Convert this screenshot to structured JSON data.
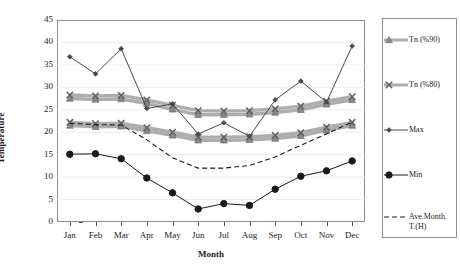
{
  "chart_data": {
    "type": "line",
    "title": "",
    "xlabel": "Month",
    "ylabel": "Temperature",
    "categories": [
      "Jan",
      "Feb",
      "Mar",
      "Apr",
      "May",
      "Jun",
      "Jul",
      "Aug",
      "Sep",
      "Oct",
      "Nov",
      "Dec"
    ],
    "ylim": [
      0,
      45
    ],
    "yticks": [
      0,
      5,
      10,
      15,
      20,
      25,
      30,
      35,
      40,
      45
    ],
    "grid": "horizontal-faint",
    "legend_position": "right-outside",
    "series": [
      {
        "name": "Tn (%90) upper",
        "legend": "Tn  (%90)",
        "marker": "triangle",
        "color": "#8a8a8a",
        "values": [
          27.5,
          27.3,
          27.4,
          26.4,
          25.1,
          23.9,
          23.9,
          24.0,
          24.4,
          25.0,
          26.2,
          27.2
        ]
      },
      {
        "name": "Tn (%80) upper",
        "legend": "Tn  (%80)",
        "marker": "cross",
        "color": "#8a8a8a",
        "values": [
          28.3,
          28.1,
          28.2,
          27.2,
          26.0,
          24.8,
          24.7,
          24.8,
          25.2,
          25.8,
          26.9,
          27.9
        ]
      },
      {
        "name": "Tn (%90) lower",
        "legend": "Tn  (%90)",
        "marker": "triangle",
        "color": "#8a8a8a",
        "values": [
          21.5,
          21.2,
          21.3,
          20.3,
          19.3,
          18.2,
          18.2,
          18.3,
          18.6,
          19.2,
          20.4,
          21.5
        ]
      },
      {
        "name": "Tn (%80) lower",
        "legend": "Tn  (%80)",
        "marker": "cross",
        "color": "#8a8a8a",
        "values": [
          22.2,
          21.9,
          22.0,
          21.0,
          20.0,
          18.9,
          18.9,
          19.0,
          19.3,
          19.9,
          21.1,
          22.2
        ]
      },
      {
        "name": "Max",
        "legend": "Max",
        "marker": "diamond",
        "color": "#4a4a4a",
        "values": [
          36.8,
          33.0,
          38.6,
          25.3,
          26.3,
          19.6,
          22.1,
          19.1,
          27.2,
          31.4,
          26.7,
          39.2
        ]
      },
      {
        "name": "Min",
        "legend": "Min",
        "marker": "circle",
        "color": "#1a1a1a",
        "values": [
          15.1,
          15.2,
          14.1,
          9.8,
          6.5,
          2.9,
          4.1,
          3.7,
          7.3,
          10.2,
          11.4,
          13.6
        ]
      },
      {
        "name": "Ave.Month.T.(H)",
        "legend": "Ave.Month.\nT.(H)",
        "marker": "none",
        "style": "dashed",
        "color": "#1a1a1a",
        "values": [
          22.0,
          21.7,
          21.6,
          18.3,
          14.3,
          12.0,
          12.0,
          12.6,
          14.5,
          17.1,
          19.6,
          22.3
        ]
      }
    ],
    "legend_entries": [
      {
        "label": "Tn  (%90)",
        "marker": "triangle",
        "color": "#8a8a8a",
        "style": "solid"
      },
      {
        "label": "Tn  (%80)",
        "marker": "cross",
        "color": "#8a8a8a",
        "style": "solid"
      },
      {
        "label": "Max",
        "marker": "diamond",
        "color": "#4a4a4a",
        "style": "solid"
      },
      {
        "label": "Min",
        "marker": "circle",
        "color": "#1a1a1a",
        "style": "solid"
      },
      {
        "label": "Ave.Month.\nT.(H)",
        "marker": "none",
        "color": "#1a1a1a",
        "style": "dashed"
      }
    ]
  }
}
